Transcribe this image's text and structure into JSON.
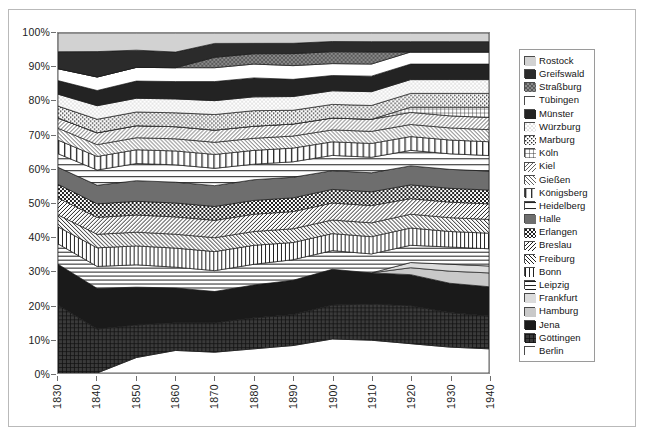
{
  "figure": {
    "axis_color": "#6f6f6f",
    "frame_color": "#8a8a8a",
    "outer_border_color": "#b9b9b9"
  },
  "chart_data": {
    "type": "area",
    "stacked": "100%",
    "title": "",
    "xlabel": "",
    "ylabel": "",
    "grid": false,
    "legend_position": "right",
    "xlim": [
      1830,
      1940
    ],
    "ylim": [
      0,
      100
    ],
    "yticks": [
      "0%",
      "10%",
      "20%",
      "30%",
      "40%",
      "50%",
      "60%",
      "70%",
      "80%",
      "90%",
      "100%"
    ],
    "ytick_values": [
      0,
      10,
      20,
      30,
      40,
      50,
      60,
      70,
      80,
      90,
      100
    ],
    "x": [
      1830,
      1840,
      1850,
      1860,
      1870,
      1880,
      1890,
      1900,
      1910,
      1920,
      1930,
      1940
    ],
    "xticks": [
      "1830",
      "1840",
      "1850",
      "1860",
      "1870",
      "1880",
      "1890",
      "1900",
      "1910",
      "1920",
      "1930",
      "1940"
    ],
    "stack_order_bottom_to_top": [
      "Berlin",
      "Göttingen",
      "Jena",
      "Hamburg",
      "Frankfurt",
      "Leipzig",
      "Bonn",
      "Freiburg",
      "Breslau",
      "Erlangen",
      "Halle",
      "Heidelberg",
      "Königsberg",
      "Gießen",
      "Kiel",
      "Köln",
      "Marburg",
      "Würzburg",
      "Münster",
      "Tübingen",
      "Straßburg",
      "Greifswald",
      "Rostock"
    ],
    "series": [
      {
        "name": "Berlin",
        "pattern": "solid-white",
        "values": [
          0.0,
          0.0,
          4.5,
          6.5,
          6.0,
          7.0,
          8.0,
          10.0,
          9.5,
          8.5,
          7.5,
          7.0
        ]
      },
      {
        "name": "Göttingen",
        "pattern": "grid-dark",
        "values": [
          20.0,
          13.0,
          9.5,
          8.0,
          8.5,
          9.0,
          9.0,
          10.0,
          10.5,
          11.0,
          10.0,
          9.5
        ]
      },
      {
        "name": "Jena",
        "pattern": "solid-black",
        "values": [
          12.0,
          12.0,
          11.0,
          10.0,
          9.0,
          9.5,
          10.0,
          10.5,
          9.0,
          9.0,
          8.5,
          8.5
        ]
      },
      {
        "name": "Hamburg",
        "pattern": "solid-lightgray",
        "values": [
          0.0,
          0.0,
          0.0,
          0.0,
          0.0,
          0.0,
          0.0,
          0.0,
          0.0,
          2.0,
          3.5,
          4.0
        ]
      },
      {
        "name": "Frankfurt",
        "pattern": "solid-palegray",
        "values": [
          0.0,
          0.0,
          0.0,
          0.0,
          0.0,
          0.0,
          0.0,
          0.0,
          0.0,
          1.5,
          2.0,
          2.0
        ]
      },
      {
        "name": "Leipzig",
        "pattern": "horiz-lines",
        "values": [
          6.0,
          6.5,
          6.5,
          6.0,
          6.0,
          6.0,
          6.0,
          5.5,
          5.5,
          5.0,
          5.0,
          5.0
        ]
      },
      {
        "name": "Bonn",
        "pattern": "vert-lines",
        "values": [
          5.0,
          5.5,
          5.5,
          5.5,
          5.5,
          5.5,
          5.0,
          5.0,
          5.0,
          5.0,
          4.5,
          4.5
        ]
      },
      {
        "name": "Freiburg",
        "pattern": "diag-back",
        "values": [
          3.5,
          4.0,
          4.0,
          4.0,
          4.0,
          4.0,
          4.0,
          4.0,
          4.0,
          4.0,
          4.0,
          4.0
        ]
      },
      {
        "name": "Breslau",
        "pattern": "diag-fwd",
        "values": [
          5.0,
          5.0,
          5.0,
          5.0,
          5.0,
          5.0,
          5.0,
          5.0,
          5.0,
          4.5,
          4.5,
          4.5
        ]
      },
      {
        "name": "Erlangen",
        "pattern": "checker-dark",
        "values": [
          4.0,
          4.0,
          4.0,
          4.0,
          4.0,
          4.0,
          4.0,
          4.0,
          4.0,
          4.0,
          4.0,
          4.0
        ]
      },
      {
        "name": "Halle",
        "pattern": "solid-darkgray",
        "values": [
          5.0,
          5.5,
          6.0,
          6.0,
          6.0,
          6.0,
          6.0,
          5.5,
          5.5,
          5.5,
          5.5,
          5.5
        ]
      },
      {
        "name": "Heidelberg",
        "pattern": "horiz-wide",
        "values": [
          4.0,
          4.5,
          5.0,
          5.0,
          5.0,
          4.5,
          4.5,
          4.5,
          4.5,
          4.5,
          4.5,
          4.5
        ]
      },
      {
        "name": "Königsberg",
        "pattern": "vert-wide",
        "values": [
          4.0,
          4.0,
          4.0,
          4.0,
          4.0,
          4.0,
          4.0,
          4.0,
          4.0,
          4.0,
          4.0,
          4.0
        ]
      },
      {
        "name": "Gießen",
        "pattern": "diag-back-fine",
        "values": [
          3.5,
          3.5,
          3.5,
          3.5,
          3.5,
          3.5,
          3.5,
          3.5,
          3.5,
          3.5,
          3.5,
          3.5
        ]
      },
      {
        "name": "Kiel",
        "pattern": "diag-fwd-fine",
        "values": [
          3.0,
          3.5,
          3.5,
          3.5,
          3.5,
          3.5,
          3.5,
          3.5,
          3.5,
          3.5,
          3.5,
          3.5
        ]
      },
      {
        "name": "Köln",
        "pattern": "grid-open",
        "values": [
          0.0,
          0.0,
          0.0,
          0.0,
          0.0,
          0.0,
          0.0,
          0.0,
          0.0,
          1.5,
          2.5,
          3.0
        ]
      },
      {
        "name": "Marburg",
        "pattern": "checker-fine",
        "values": [
          3.5,
          4.0,
          4.0,
          4.0,
          4.5,
          4.5,
          4.0,
          4.0,
          4.0,
          4.0,
          4.0,
          4.0
        ]
      },
      {
        "name": "Würzburg",
        "pattern": "dots-light",
        "values": [
          3.5,
          4.0,
          4.0,
          4.0,
          4.0,
          4.0,
          4.0,
          4.0,
          4.0,
          4.0,
          4.0,
          4.0
        ]
      },
      {
        "name": "Münster",
        "pattern": "solid-black2",
        "values": [
          4.0,
          4.5,
          5.0,
          5.0,
          5.5,
          5.5,
          5.0,
          4.5,
          4.5,
          4.5,
          4.5,
          4.5
        ]
      },
      {
        "name": "Tübingen",
        "pattern": "solid-white2",
        "values": [
          3.5,
          4.0,
          4.0,
          4.0,
          4.0,
          4.0,
          4.0,
          3.5,
          3.5,
          3.5,
          3.5,
          3.5
        ]
      },
      {
        "name": "Straßburg",
        "pattern": "dots-dark",
        "values": [
          0.0,
          0.0,
          0.0,
          0.0,
          3.0,
          3.0,
          3.5,
          3.5,
          3.5,
          0.0,
          0.0,
          0.0
        ]
      },
      {
        "name": "Greifswald",
        "pattern": "solid-black3",
        "values": [
          5.0,
          7.5,
          5.0,
          4.5,
          4.0,
          3.0,
          3.0,
          3.0,
          3.0,
          3.0,
          3.0,
          3.0
        ]
      },
      {
        "name": "Rostock",
        "pattern": "solid-palegray2",
        "values": [
          5.5,
          5.5,
          5.0,
          5.5,
          3.0,
          3.0,
          3.0,
          2.5,
          2.5,
          2.5,
          2.5,
          2.5
        ]
      }
    ]
  },
  "legend": {
    "items": [
      {
        "label": "Rostock",
        "pattern": "solid-palegray2"
      },
      {
        "label": "Greifswald",
        "pattern": "solid-black3"
      },
      {
        "label": "Straßburg",
        "pattern": "dots-dark"
      },
      {
        "label": "Tübingen",
        "pattern": "solid-white2"
      },
      {
        "label": "Münster",
        "pattern": "solid-black2"
      },
      {
        "label": "Würzburg",
        "pattern": "dots-light"
      },
      {
        "label": "Marburg",
        "pattern": "checker-fine"
      },
      {
        "label": "Köln",
        "pattern": "grid-open"
      },
      {
        "label": "Kiel",
        "pattern": "diag-fwd-fine"
      },
      {
        "label": "Gießen",
        "pattern": "diag-back-fine"
      },
      {
        "label": "Königsberg",
        "pattern": "vert-wide"
      },
      {
        "label": "Heidelberg",
        "pattern": "horiz-wide"
      },
      {
        "label": "Halle",
        "pattern": "solid-darkgray"
      },
      {
        "label": "Erlangen",
        "pattern": "checker-dark"
      },
      {
        "label": "Breslau",
        "pattern": "diag-fwd"
      },
      {
        "label": "Freiburg",
        "pattern": "diag-back"
      },
      {
        "label": "Bonn",
        "pattern": "vert-lines"
      },
      {
        "label": "Leipzig",
        "pattern": "horiz-lines"
      },
      {
        "label": "Frankfurt",
        "pattern": "solid-palegray"
      },
      {
        "label": "Hamburg",
        "pattern": "solid-lightgray"
      },
      {
        "label": "Jena",
        "pattern": "solid-black"
      },
      {
        "label": "Göttingen",
        "pattern": "grid-dark"
      },
      {
        "label": "Berlin",
        "pattern": "solid-white"
      }
    ]
  }
}
